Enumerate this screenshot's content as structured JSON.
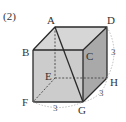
{
  "problem_number": "(2)",
  "figure": {
    "type": "cube",
    "vertices": {
      "A": {
        "label": "A",
        "x": 55,
        "y": 27
      },
      "B": {
        "label": "B",
        "x": 33,
        "y": 50
      },
      "C": {
        "label": "C",
        "x": 83,
        "y": 50
      },
      "D": {
        "label": "D",
        "x": 107,
        "y": 27
      },
      "E": {
        "label": "E",
        "x": 55,
        "y": 78
      },
      "F": {
        "label": "F",
        "x": 33,
        "y": 102
      },
      "G": {
        "label": "G",
        "x": 83,
        "y": 102
      },
      "H": {
        "label": "H",
        "x": 107,
        "y": 78
      }
    },
    "diagonal": "AG",
    "dimensions": {
      "DH": "3",
      "GH": "3",
      "FG": "3"
    },
    "colors": {
      "top_face": "#d4d4d4",
      "front_face": "#c4c4c4",
      "right_face": "#a8a8a8",
      "edge": "#2a2a2a",
      "hidden_edge": "#444444",
      "dimension_arc": "#b0b0b0"
    }
  }
}
